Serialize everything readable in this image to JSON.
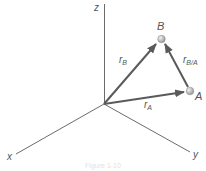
{
  "diagram": {
    "axes": {
      "x": {
        "label": "x"
      },
      "y": {
        "label": "y"
      },
      "z": {
        "label": "z"
      }
    },
    "points": {
      "A": {
        "label": "A"
      },
      "B": {
        "label": "B"
      }
    },
    "vectors": {
      "rA": {
        "main": "r",
        "sub": "A"
      },
      "rB": {
        "main": "r",
        "sub": "B"
      },
      "rBA": {
        "main": "r",
        "sub": "B/A"
      }
    },
    "caption": "Figure 1-10",
    "colors": {
      "axis": "#6b6b6b",
      "vector": "#5a5a5a",
      "point": "#bdbdbd",
      "text": "#555555"
    }
  }
}
